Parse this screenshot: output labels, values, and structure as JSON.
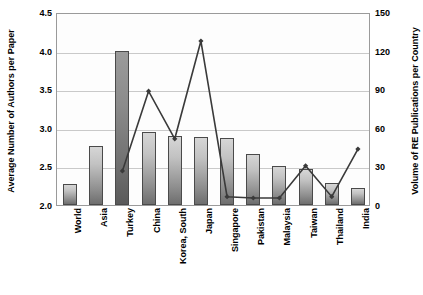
{
  "chart_data": {
    "type": "bar",
    "title": "",
    "xlabel": "",
    "ylabel": "Average Number of Authors per Paper",
    "y2label": "Volume of RE Publications per Country",
    "categories": [
      "World",
      "Asia",
      "Turkey",
      "China",
      "Korea, South",
      "Japan",
      "Singapore",
      "Pakistan",
      "Malaysia",
      "Taiwan",
      "Thailand",
      "India"
    ],
    "ylim": [
      2.0,
      4.5
    ],
    "yticks": [
      "2.0",
      "2.5",
      "3.0",
      "3.5",
      "4.0",
      "4.5"
    ],
    "y2lim": [
      0,
      150
    ],
    "y2ticks": [
      "0",
      "30",
      "60",
      "90",
      "120",
      "150"
    ],
    "grid": true,
    "legend": "none",
    "series": [
      {
        "name": "Average Number of Authors per Paper",
        "type": "bar",
        "axis": "left",
        "values": [
          2.27,
          2.77,
          4.0,
          2.95,
          2.89,
          2.88,
          2.87,
          2.66,
          2.5,
          2.47,
          2.28,
          2.22
        ]
      },
      {
        "name": "Volume of RE Publications per Country",
        "type": "line",
        "axis": "right",
        "values": [
          null,
          null,
          28,
          90,
          53,
          129,
          8,
          7,
          7,
          32,
          8,
          45
        ]
      }
    ]
  },
  "colors": {
    "bar_fill_light": "#d6d6d6",
    "bar_fill_dark": "#6e6e6e",
    "bar_border": "#4a4a4a",
    "line": "#3a3a3a",
    "grid": "#c9c9c9",
    "frame": "#9a9a9a",
    "text": "#000000"
  }
}
